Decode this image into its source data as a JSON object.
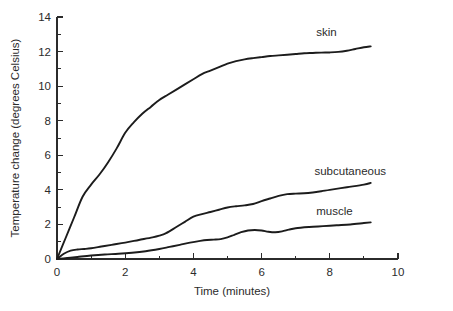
{
  "chart_data": {
    "type": "line",
    "title": "",
    "xlabel": "Time (minutes)",
    "ylabel": "Temperature change (degrees Celsius)",
    "xlim": [
      0,
      10
    ],
    "ylim": [
      0,
      14
    ],
    "grid": false,
    "legend_position": "inline-labels",
    "x_ticks": [
      "0",
      "2",
      "4",
      "6",
      "8",
      "10"
    ],
    "x_tick_values": [
      0,
      2,
      4,
      6,
      8,
      10
    ],
    "x_minor_step": 1,
    "y_ticks": [
      "0",
      "2",
      "4",
      "6",
      "8",
      "10",
      "12",
      "14"
    ],
    "y_tick_values": [
      0,
      2,
      4,
      6,
      8,
      10,
      12,
      14
    ],
    "y_minor_step": 1,
    "series": [
      {
        "name": "skin",
        "label": "skin",
        "label_x": 7.6,
        "label_y": 12.9,
        "x": [
          0,
          0.25,
          0.5,
          0.75,
          1.0,
          1.25,
          1.5,
          1.75,
          2.0,
          2.25,
          2.5,
          2.75,
          3.0,
          3.25,
          3.5,
          3.75,
          4.0,
          4.25,
          4.5,
          4.75,
          5.0,
          5.25,
          5.5,
          5.75,
          6.0,
          6.25,
          6.5,
          6.75,
          7.0,
          7.25,
          7.5,
          7.75,
          8.0,
          8.25,
          8.5,
          8.75,
          9.0,
          9.2
        ],
        "y": [
          0,
          1.2,
          2.4,
          3.6,
          4.3,
          4.9,
          5.6,
          6.4,
          7.3,
          7.9,
          8.4,
          8.8,
          9.2,
          9.5,
          9.8,
          10.1,
          10.4,
          10.7,
          10.9,
          11.1,
          11.3,
          11.45,
          11.55,
          11.62,
          11.68,
          11.74,
          11.78,
          11.82,
          11.86,
          11.9,
          11.92,
          11.94,
          11.95,
          11.98,
          12.05,
          12.15,
          12.25,
          12.3
        ]
      },
      {
        "name": "subcutaneous",
        "label": "subcutaneous",
        "label_x": 7.55,
        "label_y": 4.85,
        "x": [
          0,
          0.2,
          0.4,
          0.6,
          0.8,
          1.0,
          1.3,
          1.6,
          2.0,
          2.4,
          2.8,
          3.0,
          3.2,
          3.5,
          3.75,
          4.0,
          4.25,
          4.5,
          4.75,
          5.0,
          5.25,
          5.5,
          5.75,
          6.0,
          6.25,
          6.5,
          6.75,
          7.0,
          7.25,
          7.5,
          7.75,
          8.0,
          8.5,
          9.0,
          9.2
        ],
        "y": [
          0,
          0.3,
          0.48,
          0.55,
          0.58,
          0.62,
          0.72,
          0.82,
          0.95,
          1.1,
          1.25,
          1.35,
          1.5,
          1.85,
          2.15,
          2.45,
          2.6,
          2.72,
          2.85,
          2.98,
          3.05,
          3.1,
          3.18,
          3.35,
          3.5,
          3.65,
          3.75,
          3.78,
          3.8,
          3.85,
          3.92,
          4.0,
          4.15,
          4.3,
          4.4
        ]
      },
      {
        "name": "muscle",
        "label": "muscle",
        "label_x": 7.6,
        "label_y": 2.55,
        "x": [
          0,
          0.3,
          0.6,
          1.0,
          1.4,
          1.8,
          2.2,
          2.6,
          3.0,
          3.3,
          3.6,
          3.9,
          4.2,
          4.4,
          4.6,
          4.8,
          5.0,
          5.2,
          5.4,
          5.6,
          5.8,
          6.0,
          6.2,
          6.4,
          6.6,
          6.8,
          7.0,
          7.4,
          7.8,
          8.2,
          8.6,
          9.0,
          9.2
        ],
        "y": [
          0,
          0.06,
          0.12,
          0.2,
          0.26,
          0.3,
          0.36,
          0.45,
          0.58,
          0.7,
          0.82,
          0.95,
          1.05,
          1.1,
          1.12,
          1.15,
          1.25,
          1.4,
          1.55,
          1.65,
          1.68,
          1.65,
          1.58,
          1.55,
          1.6,
          1.7,
          1.78,
          1.85,
          1.9,
          1.95,
          2.0,
          2.08,
          2.12
        ]
      }
    ]
  }
}
